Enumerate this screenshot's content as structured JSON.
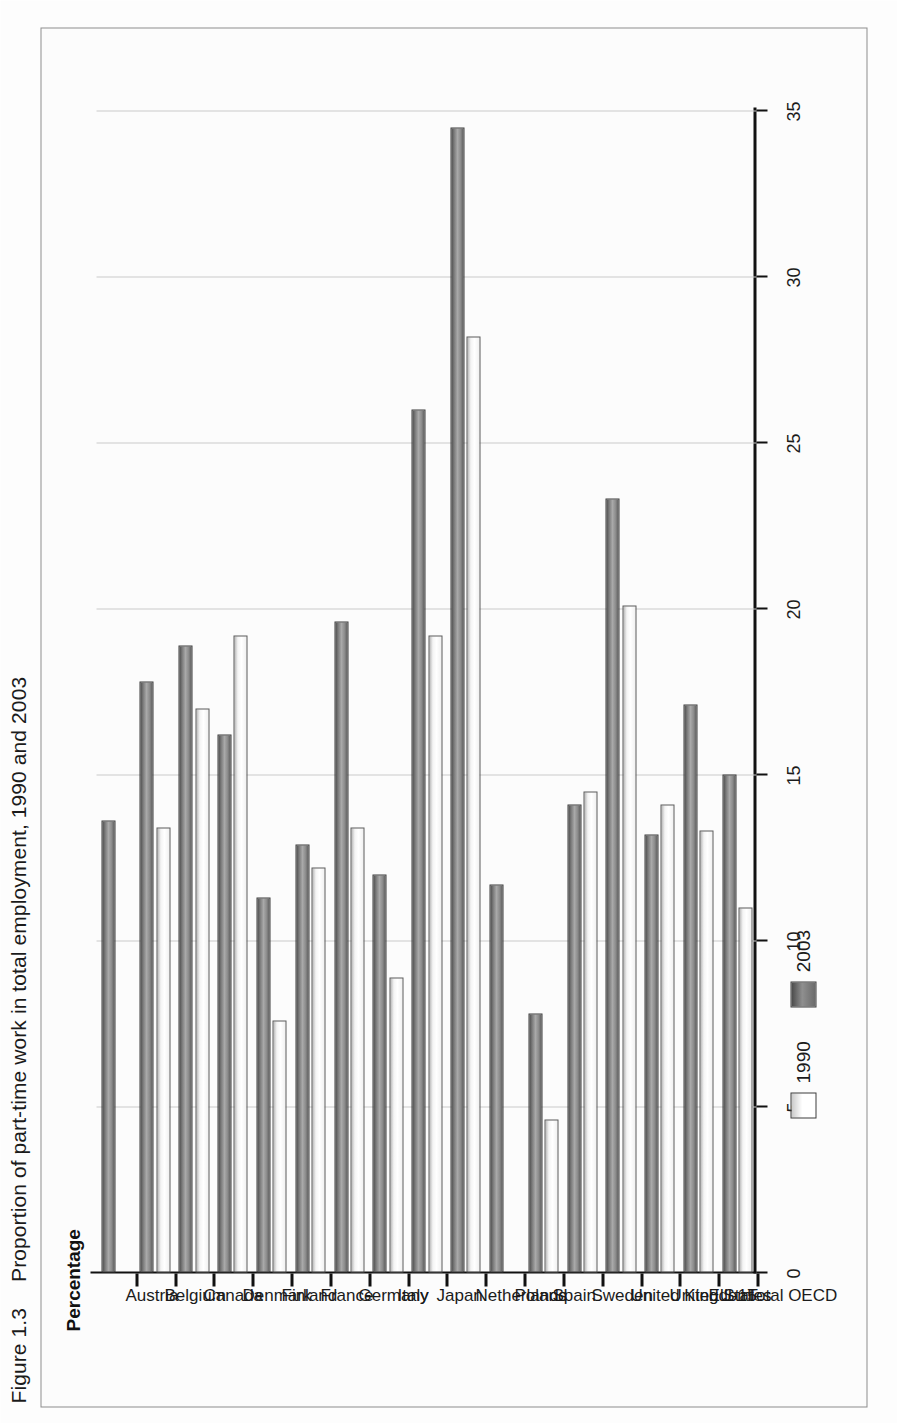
{
  "figure": {
    "number": "Figure 1.3",
    "title": "Proportion of part-time work in total employment, 1990 and 2003"
  },
  "axis": {
    "value_axis_title": "Percentage",
    "tick_labels": [
      "0",
      "5",
      "10",
      "15",
      "20",
      "25",
      "30",
      "35"
    ]
  },
  "legend": {
    "items": [
      {
        "label": "1990",
        "swatch": "light-gradient-swatch"
      },
      {
        "label": "2003",
        "swatch": "dark-gradient-swatch"
      }
    ]
  },
  "chart_data": {
    "type": "bar",
    "orientation": "horizontal",
    "title": "Proportion of part-time work in total employment, 1990 and 2003",
    "xlabel": "Percentage",
    "ylabel": "",
    "xlim": [
      0,
      35
    ],
    "grid": true,
    "legend_position": "bottom-left",
    "categories": [
      "Austria",
      "Belgium",
      "Canada",
      "Denmark",
      "Finland",
      "France",
      "Germany",
      "Italy",
      "Japan",
      "Netherlands",
      "Poland",
      "Spain",
      "Sweden",
      "United Kingdom",
      "United States",
      "EU-15",
      "Total OECD"
    ],
    "series": [
      {
        "name": "1990",
        "values": [
          0.0,
          13.4,
          17.0,
          19.2,
          7.6,
          12.2,
          13.4,
          8.9,
          19.2,
          28.2,
          0.0,
          4.6,
          14.5,
          20.1,
          14.1,
          13.3,
          11.0
        ]
      },
      {
        "name": "2003",
        "values": [
          13.6,
          17.8,
          18.9,
          16.2,
          11.3,
          12.9,
          19.6,
          12.0,
          26.0,
          34.5,
          11.7,
          7.8,
          14.1,
          23.3,
          13.2,
          17.1,
          15.0
        ]
      }
    ],
    "ticks": [
      0,
      5,
      10,
      15,
      20,
      25,
      30,
      35
    ]
  }
}
